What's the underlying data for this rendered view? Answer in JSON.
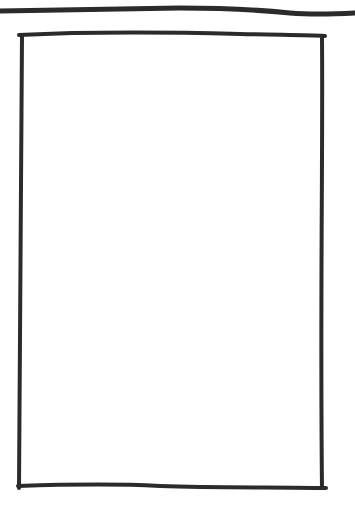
{
  "sketch": {
    "type": "hand-drawn wireframe",
    "elements": [
      {
        "kind": "horizontal-line",
        "role": "header-divider"
      },
      {
        "kind": "rectangle",
        "role": "content-frame"
      }
    ],
    "stroke_color": "#2b2b2b",
    "background": "#ffffff"
  }
}
